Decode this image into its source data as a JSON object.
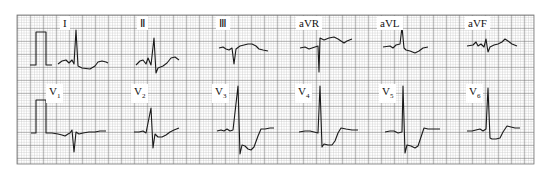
{
  "figure": {
    "grid": {
      "x0": 17,
      "y0": 15,
      "x1": 534,
      "y1": 164,
      "small_mm_px": 2.6,
      "minor_color": "#b8b8b8",
      "major_color": "#5a5a5a"
    },
    "trace_color": "#1a1a1a",
    "rows": [
      {
        "row": 1,
        "leads": [
          {
            "id": "I",
            "label": "I",
            "label_x": 62,
            "label_y": 17
          },
          {
            "id": "II",
            "label": "Ⅱ",
            "label_x": 139,
            "label_y": 17
          },
          {
            "id": "III",
            "label": "Ⅲ",
            "label_x": 218,
            "label_y": 17
          },
          {
            "id": "aVR",
            "label": "aVR",
            "label_x": 298,
            "label_y": 17
          },
          {
            "id": "aVL",
            "label": "aVL",
            "label_x": 379,
            "label_y": 17
          },
          {
            "id": "aVF",
            "label": "aVF",
            "label_x": 467,
            "label_y": 17
          }
        ]
      },
      {
        "row": 2,
        "leads": [
          {
            "id": "V1",
            "label": "V",
            "sub": "1",
            "label_x": 48,
            "label_y": 85
          },
          {
            "id": "V2",
            "label": "V",
            "sub": "2",
            "label_x": 133,
            "label_y": 85
          },
          {
            "id": "V3",
            "label": "V",
            "sub": "3",
            "label_x": 214,
            "label_y": 85
          },
          {
            "id": "V4",
            "label": "V",
            "sub": "4",
            "label_x": 297,
            "label_y": 85
          },
          {
            "id": "V5",
            "label": "V",
            "sub": "5",
            "label_x": 381,
            "label_y": 85
          },
          {
            "id": "V6",
            "label": "V",
            "sub": "6",
            "label_x": 468,
            "label_y": 85
          }
        ]
      }
    ],
    "calibration_pulse": {
      "description": "1 mV standardization square wave",
      "rows": [
        1,
        2
      ]
    }
  }
}
